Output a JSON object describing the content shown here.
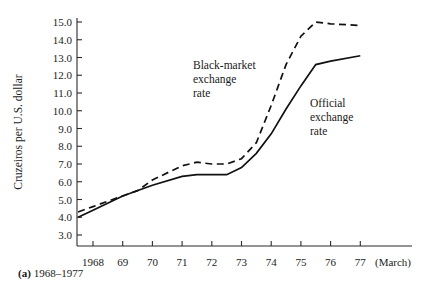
{
  "figure": {
    "caption_label": "(a)",
    "caption_text": "1968–1977"
  },
  "annotations": {
    "black_market": [
      "Black-market",
      "exchange",
      "rate"
    ],
    "official": [
      "Official",
      "exchange",
      "rate"
    ]
  },
  "chart_data": {
    "type": "line",
    "title": "",
    "xlabel": "",
    "ylabel": "Cruzeiros per U.S. dollar",
    "x_axis_suffix": "(March)",
    "ylim": [
      3.0,
      15.0
    ],
    "xlim": [
      1967.5,
      1977.0
    ],
    "grid": false,
    "legend_position": "inline-annotation",
    "y_ticks": [
      "3.0",
      "4.0",
      "5.0",
      "6.0",
      "7.0",
      "8.0",
      "9.0",
      "10.0",
      "11.0",
      "12.0",
      "13.0",
      "14.0",
      "15.0"
    ],
    "y_tick_values": [
      3.0,
      4.0,
      5.0,
      6.0,
      7.0,
      8.0,
      9.0,
      10.0,
      11.0,
      12.0,
      13.0,
      14.0,
      15.0
    ],
    "x_ticks": [
      "1968",
      "69",
      "70",
      "71",
      "72",
      "73",
      "74",
      "75",
      "76",
      "77"
    ],
    "x_tick_values": [
      1968,
      1969,
      1970,
      1971,
      1972,
      1973,
      1974,
      1975,
      1976,
      1977
    ],
    "series": [
      {
        "name": "Black-market exchange rate",
        "style": "dashed",
        "x": [
          1967.5,
          1968.0,
          1969.0,
          1969.5,
          1970.0,
          1971.0,
          1971.5,
          1972.0,
          1972.5,
          1973.0,
          1973.5,
          1974.0,
          1974.5,
          1975.0,
          1975.5,
          1976.0,
          1977.0
        ],
        "values": [
          4.3,
          4.6,
          5.2,
          5.5,
          6.1,
          6.9,
          7.1,
          7.0,
          7.0,
          7.3,
          8.2,
          10.3,
          12.6,
          14.2,
          15.0,
          14.9,
          14.8
        ]
      },
      {
        "name": "Official exchange rate",
        "style": "solid",
        "x": [
          1967.5,
          1968.0,
          1969.0,
          1970.0,
          1971.0,
          1971.5,
          1972.0,
          1972.5,
          1973.0,
          1973.5,
          1974.0,
          1974.5,
          1975.0,
          1975.5,
          1976.0,
          1977.0
        ],
        "values": [
          4.0,
          4.4,
          5.2,
          5.8,
          6.3,
          6.4,
          6.4,
          6.4,
          6.8,
          7.6,
          8.7,
          10.1,
          11.4,
          12.6,
          12.8,
          13.1
        ]
      }
    ]
  }
}
